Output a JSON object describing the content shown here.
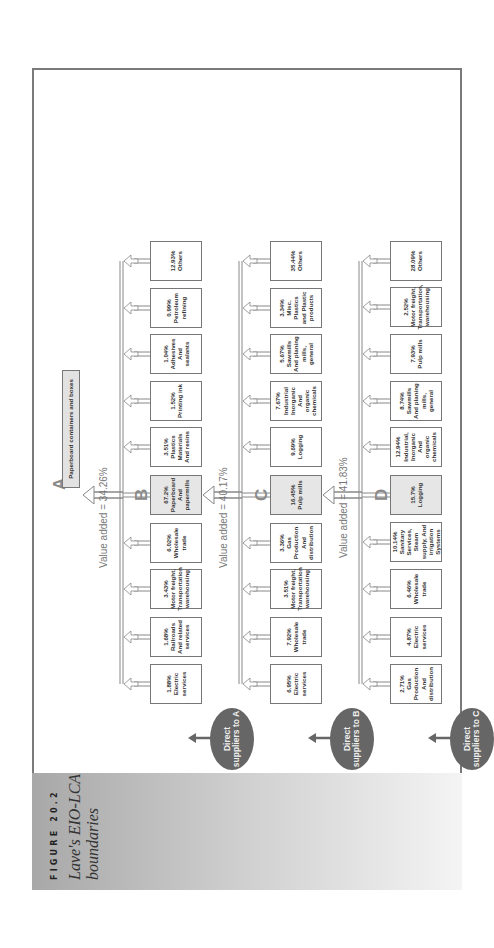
{
  "figure": {
    "label": "FIGURE 20.2",
    "title": "Lave's EIO-LCA boundaries"
  },
  "root": {
    "letter": "A",
    "label": "Paperboard containers and boxes"
  },
  "tiers": [
    {
      "ellipse": "Direct suppliers to A",
      "value_added": "Value added = 34.26%",
      "main_letter": "B",
      "boxes": [
        {
          "pct": "1.88%",
          "name": "Electric services"
        },
        {
          "pct": "1.68%",
          "name": "Railroads And related services"
        },
        {
          "pct": "3.43%",
          "name": "Motor freight, Transportation warehousing"
        },
        {
          "pct": "6.02%",
          "name": "Wholesale trade"
        },
        {
          "pct": "67.2%",
          "name": "Paperboard And papermills",
          "main": true
        },
        {
          "pct": "3.51%",
          "name": "Plastics Materials And resins"
        },
        {
          "pct": "1.52%",
          "name": "Printing ink"
        },
        {
          "pct": "1.04%",
          "name": "Adhesives And sealants"
        },
        {
          "pct": "0.99%",
          "name": "Petroleum refining"
        },
        {
          "pct": "12.93%",
          "name": "Others"
        }
      ]
    },
    {
      "ellipse": "Direct suppliers to B",
      "value_added": "Value added = 40.17%",
      "main_letter": "C",
      "boxes": [
        {
          "pct": "6.95%",
          "name": "Electric services"
        },
        {
          "pct": "7.92%",
          "name": "Wholesale trade"
        },
        {
          "pct": "3.51%",
          "name": "Motor freight, Transportation warehousing"
        },
        {
          "pct": "3.36%",
          "name": "Gas Production And distribution"
        },
        {
          "pct": "16.45%",
          "name": "Pulp mills",
          "main": true
        },
        {
          "pct": "9.69%",
          "name": "Logging"
        },
        {
          "pct": "7.67%",
          "name": "Industrial Inorganic And organic chemicals"
        },
        {
          "pct": "5.67%",
          "name": "Sawmills And planing mills, general"
        },
        {
          "pct": "3.34%",
          "name": "Misc. Plastics and Plastic products"
        },
        {
          "pct": "35.44%",
          "name": "Others"
        }
      ]
    },
    {
      "ellipse": "Direct suppliers to C",
      "value_added": "Value added = 41.83%",
      "main_letter": "D",
      "boxes": [
        {
          "pct": "2.71%",
          "name": "Gas Production And distribution"
        },
        {
          "pct": "4.87%",
          "name": "Electric services"
        },
        {
          "pct": "6.46%",
          "name": "Wholesale trade"
        },
        {
          "pct": "10.14%",
          "name": "Sanitary Services, Steam supply, And irrigation Systems"
        },
        {
          "pct": "15.7%",
          "name": "Logging",
          "main": true
        },
        {
          "pct": "12.94%",
          "name": "Industrial, Inorganic And organic chemicals"
        },
        {
          "pct": "8.74%",
          "name": "Sawmills And planing mills, general"
        },
        {
          "pct": "7.93%",
          "name": "Pulp mills"
        },
        {
          "pct": "2.52%",
          "name": "Motor freight, Transportation, warehousing"
        },
        {
          "pct": "28.09%",
          "name": "Others"
        }
      ]
    }
  ],
  "colors": {
    "ellipse": "#666666",
    "main_box": "#e6e6e6",
    "border": "#777777",
    "caption_panel": "#b0b0b0"
  }
}
